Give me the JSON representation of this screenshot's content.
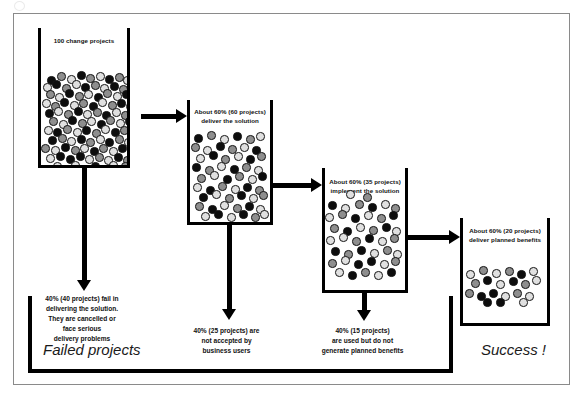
{
  "diagram": {
    "title_visible": false,
    "stages": [
      {
        "id": "stage-1",
        "label": "100 change projects",
        "dot_count": 100,
        "outflow_caption": "40% (40 projects) fail in\ndelivering the solution.\nThey are cancelled or\nface serious\ndelivery problems",
        "outflow_lines": [
          "40% (40 projects) fail in",
          "delivering the solution.",
          "They are cancelled or",
          "face serious",
          "delivery problems"
        ]
      },
      {
        "id": "stage-2",
        "label_lines": [
          "About 60% (60 projects)",
          "deliver the solution"
        ],
        "dot_count": 60,
        "outflow_lines": [
          "40% (25 projects) are",
          "not accepted by",
          "business users"
        ]
      },
      {
        "id": "stage-3",
        "label_lines": [
          "About 60% (35 projects)",
          "implement the solution"
        ],
        "dot_count": 35,
        "outflow_lines": [
          "40% (15 projects)",
          "are used but do not",
          "generate planned benefits"
        ]
      },
      {
        "id": "stage-4",
        "label_lines": [
          "About 60% (20 projects)",
          "deliver planned benefits"
        ],
        "dot_count": 20,
        "outflow_lines": []
      }
    ],
    "outcomes": {
      "failed": "Failed projects",
      "success": "Success !"
    },
    "colors": {
      "ink": "#000000",
      "dot_dark": "#0d0d0d",
      "dot_mid": "#8e8e8e",
      "dot_light": "#e0e0e0",
      "frame": "#8a8a8a",
      "background": "#ffffff"
    },
    "dot_layouts": {
      "stage1": [
        [
          6,
          48,
          "k"
        ],
        [
          16,
          44,
          "m"
        ],
        [
          26,
          47,
          "l"
        ],
        [
          36,
          43,
          "k"
        ],
        [
          45,
          46,
          "m"
        ],
        [
          55,
          44,
          "l"
        ],
        [
          64,
          47,
          "k"
        ],
        [
          74,
          45,
          "m"
        ],
        [
          82,
          48,
          "l"
        ],
        [
          2,
          55,
          "l"
        ],
        [
          11,
          52,
          "k"
        ],
        [
          21,
          56,
          "m"
        ],
        [
          31,
          52,
          "l"
        ],
        [
          40,
          55,
          "k"
        ],
        [
          50,
          53,
          "m"
        ],
        [
          59,
          56,
          "l"
        ],
        [
          69,
          54,
          "k"
        ],
        [
          78,
          57,
          "m"
        ],
        [
          86,
          53,
          "l"
        ],
        [
          5,
          62,
          "m"
        ],
        [
          14,
          65,
          "l"
        ],
        [
          24,
          61,
          "k"
        ],
        [
          34,
          64,
          "m"
        ],
        [
          43,
          62,
          "l"
        ],
        [
          53,
          65,
          "k"
        ],
        [
          62,
          61,
          "m"
        ],
        [
          72,
          64,
          "l"
        ],
        [
          81,
          62,
          "k"
        ],
        [
          1,
          71,
          "l"
        ],
        [
          10,
          74,
          "m"
        ],
        [
          19,
          70,
          "k"
        ],
        [
          29,
          73,
          "l"
        ],
        [
          38,
          71,
          "m"
        ],
        [
          48,
          74,
          "k"
        ],
        [
          57,
          70,
          "l"
        ],
        [
          67,
          73,
          "m"
        ],
        [
          76,
          71,
          "k"
        ],
        [
          85,
          74,
          "l"
        ],
        [
          4,
          81,
          "k"
        ],
        [
          13,
          79,
          "l"
        ],
        [
          23,
          82,
          "m"
        ],
        [
          33,
          79,
          "k"
        ],
        [
          42,
          82,
          "l"
        ],
        [
          52,
          80,
          "m"
        ],
        [
          61,
          83,
          "k"
        ],
        [
          71,
          80,
          "l"
        ],
        [
          80,
          83,
          "m"
        ],
        [
          8,
          89,
          "m"
        ],
        [
          18,
          92,
          "l"
        ],
        [
          27,
          88,
          "k"
        ],
        [
          37,
          91,
          "m"
        ],
        [
          46,
          89,
          "l"
        ],
        [
          56,
          92,
          "k"
        ],
        [
          65,
          88,
          "m"
        ],
        [
          75,
          91,
          "l"
        ],
        [
          84,
          89,
          "k"
        ],
        [
          3,
          98,
          "l"
        ],
        [
          12,
          100,
          "k"
        ],
        [
          22,
          97,
          "m"
        ],
        [
          32,
          100,
          "l"
        ],
        [
          41,
          98,
          "k"
        ],
        [
          51,
          101,
          "m"
        ],
        [
          60,
          97,
          "l"
        ],
        [
          70,
          100,
          "k"
        ],
        [
          79,
          98,
          "m"
        ],
        [
          7,
          108,
          "k"
        ],
        [
          17,
          106,
          "m"
        ],
        [
          26,
          109,
          "l"
        ],
        [
          36,
          107,
          "k"
        ],
        [
          45,
          110,
          "m"
        ],
        [
          55,
          107,
          "l"
        ],
        [
          64,
          110,
          "k"
        ],
        [
          74,
          107,
          "m"
        ],
        [
          83,
          110,
          "l"
        ],
        [
          0,
          116,
          "m"
        ],
        [
          10,
          118,
          "l"
        ],
        [
          20,
          115,
          "k"
        ],
        [
          30,
          118,
          "m"
        ],
        [
          39,
          116,
          "l"
        ],
        [
          49,
          119,
          "k"
        ],
        [
          58,
          116,
          "m"
        ],
        [
          68,
          119,
          "l"
        ],
        [
          77,
          116,
          "k"
        ],
        [
          86,
          119,
          "m"
        ],
        [
          5,
          126,
          "l"
        ],
        [
          15,
          124,
          "k"
        ],
        [
          25,
          127,
          "k"
        ],
        [
          35,
          124,
          "k"
        ],
        [
          44,
          127,
          "l"
        ],
        [
          54,
          125,
          "m"
        ],
        [
          63,
          128,
          "l"
        ],
        [
          73,
          125,
          "k"
        ],
        [
          82,
          128,
          "m"
        ],
        [
          12,
          134,
          "l"
        ],
        [
          30,
          133,
          "l"
        ],
        [
          50,
          134,
          "k"
        ],
        [
          68,
          133,
          "l"
        ],
        [
          80,
          134,
          "m"
        ]
      ],
      "stage2": [
        [
          4,
          34,
          "k"
        ],
        [
          17,
          31,
          "m"
        ],
        [
          30,
          35,
          "l"
        ],
        [
          43,
          32,
          "k"
        ],
        [
          56,
          35,
          "m"
        ],
        [
          66,
          32,
          "l"
        ],
        [
          1,
          43,
          "m"
        ],
        [
          13,
          46,
          "l"
        ],
        [
          26,
          42,
          "k"
        ],
        [
          38,
          45,
          "m"
        ],
        [
          50,
          43,
          "l"
        ],
        [
          62,
          46,
          "k"
        ],
        [
          6,
          54,
          "l"
        ],
        [
          19,
          51,
          "k"
        ],
        [
          31,
          55,
          "m"
        ],
        [
          44,
          52,
          "l"
        ],
        [
          56,
          55,
          "k"
        ],
        [
          67,
          52,
          "m"
        ],
        [
          2,
          63,
          "k"
        ],
        [
          15,
          66,
          "m"
        ],
        [
          27,
          62,
          "l"
        ],
        [
          40,
          65,
          "k"
        ],
        [
          52,
          63,
          "m"
        ],
        [
          64,
          66,
          "l"
        ],
        [
          7,
          74,
          "m"
        ],
        [
          20,
          71,
          "l"
        ],
        [
          33,
          75,
          "k"
        ],
        [
          45,
          72,
          "m"
        ],
        [
          58,
          75,
          "l"
        ],
        [
          68,
          72,
          "k"
        ],
        [
          3,
          83,
          "l"
        ],
        [
          16,
          86,
          "k"
        ],
        [
          28,
          82,
          "m"
        ],
        [
          41,
          85,
          "l"
        ],
        [
          53,
          83,
          "k"
        ],
        [
          65,
          86,
          "m"
        ],
        [
          9,
          93,
          "k"
        ],
        [
          22,
          90,
          "l"
        ],
        [
          35,
          94,
          "m"
        ],
        [
          47,
          91,
          "k"
        ],
        [
          59,
          94,
          "l"
        ],
        [
          69,
          91,
          "m"
        ],
        [
          5,
          102,
          "m"
        ],
        [
          18,
          105,
          "k"
        ],
        [
          30,
          101,
          "l"
        ],
        [
          43,
          104,
          "m"
        ],
        [
          55,
          102,
          "k"
        ],
        [
          66,
          105,
          "l"
        ],
        [
          11,
          112,
          "l"
        ],
        [
          24,
          110,
          "k"
        ],
        [
          37,
          113,
          "l"
        ],
        [
          49,
          110,
          "k"
        ],
        [
          61,
          113,
          "m"
        ],
        [
          70,
          110,
          "l"
        ]
      ],
      "stage3": [
        [
          21,
          22,
          "l"
        ],
        [
          38,
          25,
          "m"
        ],
        [
          3,
          33,
          "k"
        ],
        [
          16,
          36,
          "l"
        ],
        [
          30,
          32,
          "m"
        ],
        [
          43,
          35,
          "k"
        ],
        [
          56,
          32,
          "l"
        ],
        [
          66,
          36,
          "m"
        ],
        [
          0,
          45,
          "l"
        ],
        [
          13,
          42,
          "m"
        ],
        [
          26,
          46,
          "k"
        ],
        [
          39,
          43,
          "l"
        ],
        [
          52,
          46,
          "m"
        ],
        [
          64,
          43,
          "k"
        ],
        [
          5,
          56,
          "m"
        ],
        [
          18,
          59,
          "k"
        ],
        [
          31,
          55,
          "l"
        ],
        [
          44,
          58,
          "m"
        ],
        [
          57,
          55,
          "k"
        ],
        [
          67,
          59,
          "l"
        ],
        [
          1,
          68,
          "l"
        ],
        [
          14,
          65,
          "l"
        ],
        [
          27,
          69,
          "m"
        ],
        [
          40,
          66,
          "k"
        ],
        [
          53,
          69,
          "l"
        ],
        [
          65,
          66,
          "m"
        ],
        [
          6,
          79,
          "k"
        ],
        [
          19,
          82,
          "m"
        ],
        [
          32,
          78,
          "k"
        ],
        [
          45,
          81,
          "l"
        ],
        [
          58,
          78,
          "m"
        ],
        [
          68,
          82,
          "l"
        ],
        [
          3,
          91,
          "m"
        ],
        [
          16,
          88,
          "l"
        ],
        [
          29,
          92,
          "k"
        ],
        [
          42,
          89,
          "k"
        ],
        [
          55,
          92,
          "l"
        ],
        [
          66,
          89,
          "m"
        ],
        [
          10,
          100,
          "l"
        ],
        [
          23,
          103,
          "k"
        ],
        [
          36,
          100,
          "m"
        ],
        [
          49,
          103,
          "l"
        ],
        [
          62,
          100,
          "k"
        ]
      ],
      "stage4": [
        [
          3,
          52,
          "l"
        ],
        [
          16,
          48,
          "m"
        ],
        [
          29,
          51,
          "l"
        ],
        [
          42,
          49,
          "m"
        ],
        [
          54,
          52,
          "k"
        ],
        [
          66,
          49,
          "l"
        ],
        [
          8,
          61,
          "m"
        ],
        [
          20,
          58,
          "k"
        ],
        [
          33,
          62,
          "l"
        ],
        [
          46,
          59,
          "k"
        ],
        [
          58,
          62,
          "m"
        ],
        [
          69,
          58,
          "l"
        ],
        [
          2,
          71,
          "m"
        ],
        [
          14,
          74,
          "k"
        ],
        [
          26,
          71,
          "k"
        ],
        [
          38,
          74,
          "l"
        ],
        [
          50,
          71,
          "m"
        ],
        [
          62,
          74,
          "l"
        ],
        [
          20,
          80,
          "k"
        ],
        [
          33,
          80,
          "k"
        ],
        [
          56,
          80,
          "l"
        ]
      ]
    }
  }
}
